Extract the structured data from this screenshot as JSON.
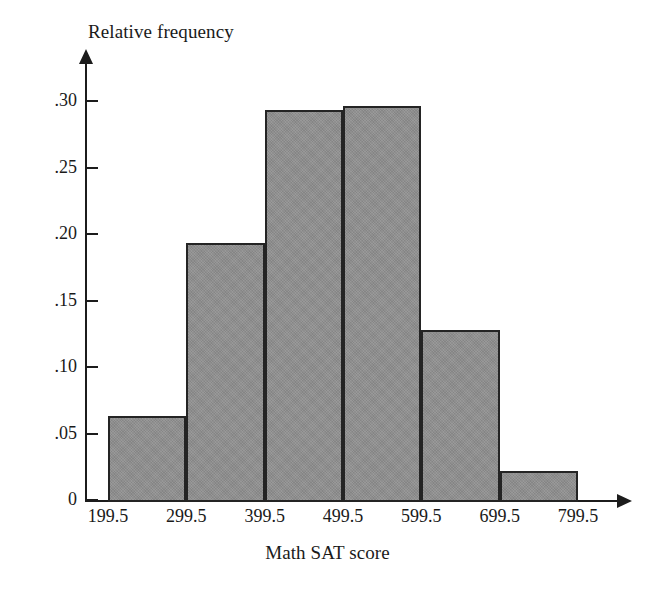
{
  "chart_data": {
    "type": "bar",
    "title": "",
    "xlabel": "Math SAT score",
    "ylabel": "Relative frequency",
    "bin_edges": [
      199.5,
      299.5,
      399.5,
      499.5,
      599.5,
      699.5,
      799.5
    ],
    "categories": [
      "199.5-299.5",
      "299.5-399.5",
      "399.5-499.5",
      "499.5-599.5",
      "599.5-699.5",
      "699.5-799.5"
    ],
    "values": [
      0.063,
      0.193,
      0.293,
      0.296,
      0.128,
      0.022
    ],
    "xtick_labels": [
      "199.5",
      "299.5",
      "399.5",
      "499.5",
      "599.5",
      "699.5",
      "799.5"
    ],
    "ytick_labels": [
      ".30",
      ".25",
      ".20",
      ".15",
      ".10",
      ".05",
      "0"
    ],
    "ytick_values": [
      0.3,
      0.25,
      0.2,
      0.15,
      0.1,
      0.05,
      0
    ],
    "ylim": [
      0,
      0.3175
    ],
    "xlim": [
      199.5,
      799.5
    ],
    "grid": false,
    "legend": null,
    "bar_fill_color": "#8e8e8e",
    "bar_edge_color": "#242424",
    "axis_color": "#1c1c1c"
  }
}
